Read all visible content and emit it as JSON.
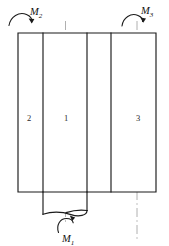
{
  "figure": {
    "background_color": "#ffffff",
    "outline_color": "#1b1b1b",
    "centerline_color": "#b0b0b0",
    "label_color": "#111111"
  },
  "moments": {
    "m1": {
      "symbol": "M",
      "subscript": "1",
      "position": "bottom-center"
    },
    "m2": {
      "symbol": "M",
      "subscript": "2",
      "position": "top-left"
    },
    "m3": {
      "symbol": "M",
      "subscript": "3",
      "position": "top-right"
    }
  },
  "segments": [
    {
      "id": "seg-2",
      "label": "2"
    },
    {
      "id": "seg-1",
      "label": "1"
    },
    {
      "id": "seg-3",
      "label": "3"
    }
  ],
  "centerlines": [
    {
      "id": "centerline-left",
      "style": "dash-dot"
    },
    {
      "id": "centerline-right",
      "style": "dash-dot"
    }
  ]
}
